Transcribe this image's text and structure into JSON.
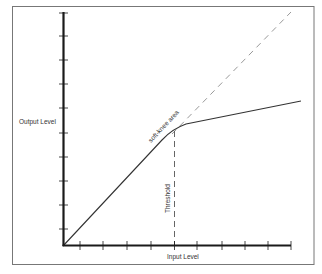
{
  "diagram": {
    "x_axis_label": "Input Level",
    "y_axis_label": "Output Level",
    "threshold_label": "Threshold",
    "knee_label": "soft-knee area",
    "x_ticks": 9,
    "y_ticks": 10,
    "colors": {
      "frame": "#777777",
      "axis": "#1a1a1a",
      "curve": "#333333",
      "dashed": "#888888",
      "threshold": "#555555"
    }
  }
}
